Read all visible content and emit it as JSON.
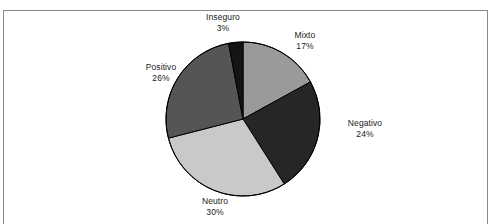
{
  "figure": {
    "background_color": "#ffffff",
    "border_color": "#8a8a8a",
    "label_text_color": "#1a1a1a",
    "slice_outline_color": "#000000"
  },
  "chart_data": {
    "type": "pie",
    "title": "",
    "subtitle": "",
    "xlabel": "",
    "ylabel": "",
    "legend_position": "none",
    "grid": false,
    "units": "percent",
    "total": 100,
    "start_angle_deg": 0,
    "direction": "clockwise",
    "categories": [
      "Mixto",
      "Negativo",
      "Neutro",
      "Positivo",
      "Inseguro"
    ],
    "values": [
      17,
      24,
      30,
      26,
      3
    ],
    "colors": [
      "#9a9a9a",
      "#262626",
      "#c9c9c9",
      "#555555",
      "#141414"
    ],
    "labels": [
      "17%",
      "24%",
      "30%",
      "26%",
      "3%"
    ],
    "slices": [
      {
        "name": "Mixto",
        "value": 17,
        "label": "17%",
        "color": "#9a9a9a"
      },
      {
        "name": "Negativo",
        "value": 24,
        "label": "24%",
        "color": "#262626"
      },
      {
        "name": "Neutro",
        "value": 30,
        "label": "30%",
        "color": "#c9c9c9"
      },
      {
        "name": "Positivo",
        "value": 26,
        "label": "26%",
        "color": "#555555"
      },
      {
        "name": "Inseguro",
        "value": 3,
        "label": "3%",
        "color": "#141414"
      }
    ]
  }
}
